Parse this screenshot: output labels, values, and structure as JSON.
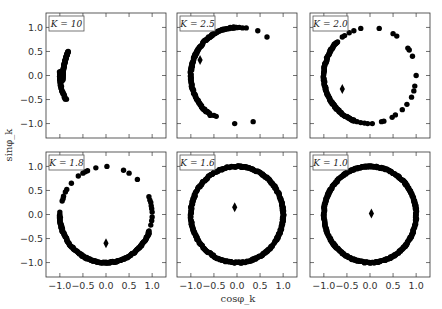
{
  "chart_data": {
    "type": "scatter",
    "layout": "2x3 grid of subplots",
    "xlabel": "cosφ_k",
    "ylabel": "sinφ_k",
    "xlim": [
      -1.3,
      1.3
    ],
    "ylim": [
      -1.3,
      1.3
    ],
    "xticks": [
      -1.0,
      -0.5,
      0.0,
      0.5,
      1.0
    ],
    "yticks": [
      1.0,
      0.5,
      0.0,
      -0.5,
      -1.0
    ],
    "xtick_labels": [
      "−1.0",
      "−0.5",
      "0.0",
      "0.5",
      "1.0"
    ],
    "ytick_labels": [
      "1.0",
      "0.5",
      "0.0",
      "−0.5",
      "−1.0"
    ],
    "grid": false,
    "point_color": "#000000",
    "panels": [
      {
        "label": "K = 10",
        "K": 10,
        "order_parameter": null,
        "dense_arcs_deg": [
          [
            175,
            210
          ]
        ],
        "scattered_points": [],
        "centroid_marker": null
      },
      {
        "label": "K = 2.5",
        "K": 2.5,
        "dense_arcs_deg": [
          [
            90,
            235
          ]
        ],
        "scattered_points": [
          [
            0.05,
            1.0
          ],
          [
            0.12,
            0.99
          ],
          [
            0.2,
            0.99
          ],
          [
            0.45,
            0.93
          ],
          [
            0.65,
            0.8
          ],
          [
            -0.5,
            -0.83
          ],
          [
            -0.45,
            -0.85
          ],
          [
            -0.05,
            -1.0
          ],
          [
            0.35,
            -0.96
          ]
        ],
        "centroid_marker": [
          -0.8,
          0.32
        ]
      },
      {
        "label": "K = 2.0",
        "K": 2.0,
        "dense_arcs_deg": [
          [
            135,
            250
          ]
        ],
        "scattered_points": [
          [
            -0.6,
            0.8
          ],
          [
            -0.55,
            0.83
          ],
          [
            -0.45,
            0.89
          ],
          [
            -0.35,
            0.93
          ],
          [
            -0.2,
            0.98
          ],
          [
            0.2,
            0.98
          ],
          [
            0.5,
            0.87
          ],
          [
            0.58,
            0.82
          ],
          [
            0.82,
            0.57
          ],
          [
            0.85,
            0.53
          ],
          [
            0.92,
            0.4
          ],
          [
            1.0,
            0.0
          ],
          [
            0.97,
            -0.22
          ],
          [
            0.95,
            -0.32
          ],
          [
            0.9,
            -0.45
          ],
          [
            0.8,
            -0.6
          ],
          [
            0.7,
            -0.71
          ],
          [
            0.55,
            -0.82
          ],
          [
            0.48,
            -0.87
          ],
          [
            0.3,
            -0.95
          ],
          [
            0.25,
            -0.96
          ],
          [
            0.05,
            -1.0
          ],
          [
            -0.05,
            -1.0
          ],
          [
            -0.12,
            -0.99
          ],
          [
            -0.2,
            -0.98
          ],
          [
            -0.28,
            -0.96
          ],
          [
            -0.35,
            -0.94
          ]
        ],
        "centroid_marker": [
          -0.6,
          -0.28
        ]
      },
      {
        "label": "K = 1.8",
        "K": 1.8,
        "dense_arcs_deg": [
          [
            180,
            340
          ]
        ],
        "scattered_points": [
          [
            -0.45,
            0.89
          ],
          [
            -0.4,
            0.91
          ],
          [
            -0.5,
            0.86
          ],
          [
            -0.6,
            0.8
          ],
          [
            -0.22,
            0.97
          ],
          [
            0.02,
            1.0
          ],
          [
            0.38,
            0.92
          ],
          [
            0.5,
            0.86
          ],
          [
            0.68,
            0.73
          ],
          [
            -0.75,
            0.65
          ],
          [
            -0.85,
            0.52
          ],
          [
            -0.88,
            0.47
          ],
          [
            -0.92,
            0.38
          ],
          [
            -0.93,
            0.33
          ],
          [
            -0.95,
            0.28
          ],
          [
            -1.0,
            0.05
          ],
          [
            0.93,
            0.37
          ],
          [
            0.95,
            0.3
          ],
          [
            0.97,
            0.25
          ],
          [
            0.98,
            0.18
          ],
          [
            0.99,
            0.12
          ],
          [
            1.0,
            0.05
          ],
          [
            1.0,
            -0.05
          ],
          [
            0.99,
            -0.13
          ],
          [
            0.97,
            -0.22
          ]
        ],
        "centroid_marker": [
          0.0,
          -0.6
        ]
      },
      {
        "label": "K = 1.6",
        "K": 1.6,
        "dense_arcs_deg": [
          [
            0,
            360
          ]
        ],
        "scattered_points": [],
        "centroid_marker": [
          -0.05,
          0.15
        ]
      },
      {
        "label": "K = 1.0",
        "K": 1.0,
        "dense_arcs_deg": [
          [
            0,
            360
          ]
        ],
        "scattered_points": [],
        "centroid_marker": [
          0.03,
          0.02
        ]
      }
    ]
  }
}
